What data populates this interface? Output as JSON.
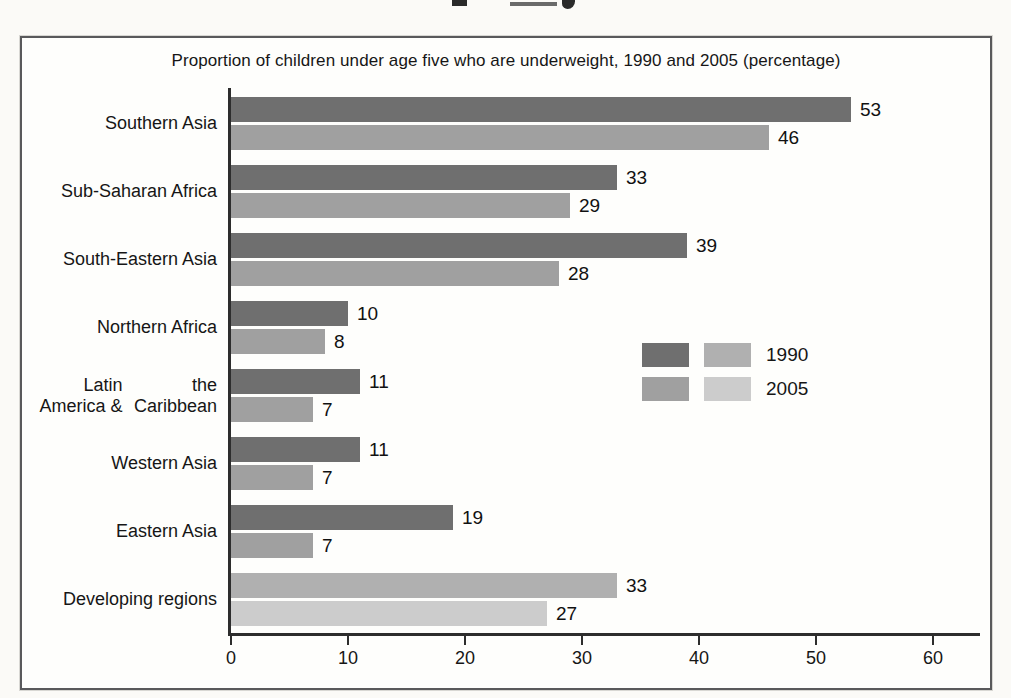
{
  "chart": {
    "box": "framed chart panel on scanned page",
    "cropped_top_text": "partially cut-off bold heading (only letter bottoms visible)"
  },
  "chart_data": {
    "type": "bar",
    "orientation": "horizontal",
    "title": "Proportion of children under age five who are underweight, 1990 and 2005 (percentage)",
    "categories": [
      "Southern Asia",
      "Sub-Saharan Africa",
      "South-Eastern Asia",
      "Northern Africa",
      "Latin America & the Caribbean",
      "Western Asia",
      "Eastern Asia",
      "Developing regions"
    ],
    "category_label_lines": [
      [
        "Southern Asia"
      ],
      [
        "Sub-Saharan Africa"
      ],
      [
        "South-Eastern Asia"
      ],
      [
        "Northern Africa"
      ],
      [
        "Latin America &",
        "the Caribbean"
      ],
      [
        "Western Asia"
      ],
      [
        "Eastern Asia"
      ],
      [
        "Developing regions"
      ]
    ],
    "series": [
      {
        "name": "1990",
        "values": [
          53,
          33,
          39,
          10,
          11,
          11,
          19,
          33
        ]
      },
      {
        "name": "2005",
        "values": [
          46,
          29,
          28,
          8,
          7,
          7,
          7,
          27
        ]
      }
    ],
    "value_labels_shown": true,
    "xlabel": "",
    "ylabel": "",
    "xlim": [
      0,
      60
    ],
    "xticks": [
      0,
      10,
      20,
      30,
      40,
      50,
      60
    ],
    "grid": false,
    "legend_position": "center-right",
    "palettes": {
      "regions": {
        "1990": "#6f6f6f",
        "2005": "#a0a0a0"
      },
      "developing": {
        "1990": "#b0b0b0",
        "2005": "#cccccc"
      }
    },
    "category_palette": [
      "regions",
      "regions",
      "regions",
      "regions",
      "regions",
      "regions",
      "regions",
      "developing"
    ],
    "legend": {
      "rows": [
        {
          "label": "1990",
          "swatch_colors": [
            "#6f6f6f",
            "#b0b0b0"
          ]
        },
        {
          "label": "2005",
          "swatch_colors": [
            "#a0a0a0",
            "#cccccc"
          ]
        }
      ]
    },
    "axis_color": "#2d2d2d"
  }
}
